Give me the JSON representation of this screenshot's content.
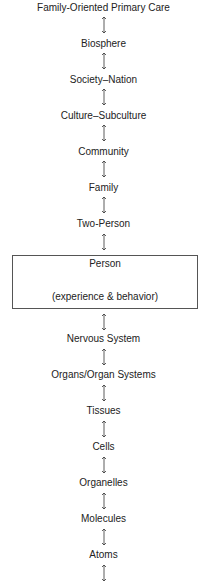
{
  "diagram": {
    "title": "Family-Oriented Primary Care",
    "levels_above": [
      "Biosphere",
      "Society–Nation",
      "Culture–Subculture",
      "Community",
      "Family",
      "Two-Person"
    ],
    "person": {
      "label": "Person",
      "sublabel": "(experience & behavior)"
    },
    "levels_below": [
      "Nervous System",
      "Organs/Organ Systems",
      "Tissues",
      "Cells",
      "Organelles",
      "Molecules",
      "Atoms"
    ],
    "connector": "double-headed-arrow"
  }
}
